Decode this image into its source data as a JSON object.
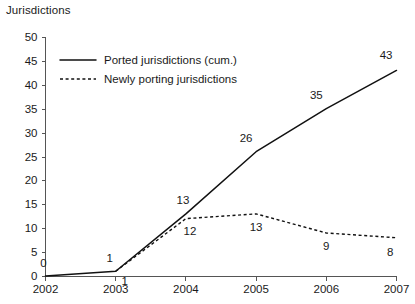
{
  "chart_data": {
    "type": "line",
    "title": "",
    "xlabel": "",
    "ylabel": "Jurisdictions",
    "categories": [
      "2002",
      "2003",
      "2004",
      "2005",
      "2006",
      "2007"
    ],
    "x": [
      2002,
      2003,
      2004,
      2005,
      2006,
      2007
    ],
    "xlim": [
      2002,
      2007
    ],
    "ylim": [
      0,
      50
    ],
    "ytick_step": 5,
    "yticks": [
      "0",
      "5",
      "10",
      "15",
      "20",
      "25",
      "30",
      "35",
      "40",
      "45",
      "50"
    ],
    "ytick_values": [
      0,
      5,
      10,
      15,
      20,
      25,
      30,
      35,
      40,
      45,
      50
    ],
    "grid": false,
    "legend_position": "top-left",
    "series": [
      {
        "name": "Ported jurisdictions (cum.)",
        "style": "solid",
        "color": "#111111",
        "values": [
          0,
          1,
          13,
          26,
          35,
          43
        ],
        "labels": [
          "0",
          "1",
          "13",
          "26",
          "35",
          "43"
        ],
        "label_side": "above"
      },
      {
        "name": "Newly porting jurisdictions",
        "style": "dashed",
        "color": "#111111",
        "values": [
          null,
          1,
          12,
          13,
          9,
          8
        ],
        "labels": [
          "",
          "1",
          "12",
          "13",
          "9",
          "8"
        ],
        "label_side": "below"
      }
    ]
  },
  "legend": {
    "items": [
      {
        "label": "Ported jurisdictions (cum.)",
        "style": "solid"
      },
      {
        "label": "Newly porting jurisdictions",
        "style": "dashed"
      }
    ]
  },
  "axis": {
    "y_title": "Jurisdictions"
  }
}
